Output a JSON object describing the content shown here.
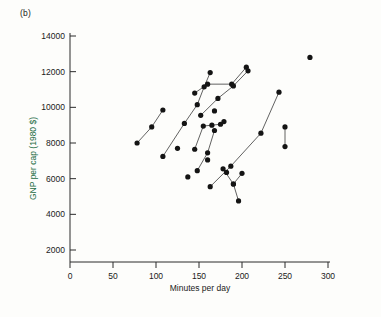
{
  "figure": {
    "panel_label": "(b)",
    "background_color": "#fdfdfb"
  },
  "axes": {
    "x": {
      "title": "Minutes per day",
      "ticks": [
        0,
        50,
        100,
        150,
        200,
        250,
        300
      ],
      "tick_labels": [
        "0",
        "50",
        "100",
        "150",
        "200",
        "250",
        "300"
      ],
      "min": 0,
      "max": 300,
      "title_color": "#1a1a1a"
    },
    "y": {
      "title": "GNP per cap (1980 $)",
      "ticks": [
        2000,
        4000,
        6000,
        8000,
        10000,
        12000,
        14000
      ],
      "tick_labels": [
        "2000",
        "4000",
        "6000",
        "8000",
        "10000",
        "12000",
        "14000"
      ],
      "min": 0,
      "max": 14800,
      "title_color": "#1a6b42"
    }
  },
  "chart_data": {
    "type": "scatter",
    "title": "",
    "xlabel": "Minutes per day",
    "ylabel": "GNP per cap (1980 $)",
    "xlim": [
      0,
      300
    ],
    "ylim": [
      0,
      14800
    ],
    "grid": false,
    "legend": null,
    "marker_color": "#141414",
    "line_color": "#3a3a3a",
    "note": "Connected point pairs/chains are trajectories for one country over time; isolated dots are unconnected observations.",
    "series": [
      {
        "name": "trajectory-1",
        "connected": true,
        "color": "#141414",
        "points": [
          {
            "x": 78,
            "y": 8000
          },
          {
            "x": 95,
            "y": 8900
          },
          {
            "x": 108,
            "y": 9850
          }
        ]
      },
      {
        "name": "trajectory-2",
        "connected": true,
        "color": "#141414",
        "points": [
          {
            "x": 108,
            "y": 7250
          },
          {
            "x": 133,
            "y": 9100
          },
          {
            "x": 148,
            "y": 10150
          },
          {
            "x": 156,
            "y": 11150
          },
          {
            "x": 163,
            "y": 11950
          }
        ]
      },
      {
        "name": "trajectory-3",
        "connected": true,
        "color": "#141414",
        "points": [
          {
            "x": 145,
            "y": 10800
          },
          {
            "x": 160,
            "y": 11300
          },
          {
            "x": 188,
            "y": 11300
          },
          {
            "x": 205,
            "y": 12250
          }
        ]
      },
      {
        "name": "trajectory-4",
        "connected": true,
        "color": "#141414",
        "points": [
          {
            "x": 152,
            "y": 9550
          },
          {
            "x": 172,
            "y": 10500
          },
          {
            "x": 190,
            "y": 11200
          },
          {
            "x": 207,
            "y": 12050
          }
        ]
      },
      {
        "name": "trajectory-5",
        "connected": true,
        "color": "#141414",
        "points": [
          {
            "x": 145,
            "y": 7650
          },
          {
            "x": 155,
            "y": 8950
          },
          {
            "x": 165,
            "y": 9000
          },
          {
            "x": 175,
            "y": 9050
          }
        ]
      },
      {
        "name": "trajectory-6",
        "connected": true,
        "color": "#141414",
        "points": [
          {
            "x": 148,
            "y": 6450
          },
          {
            "x": 160,
            "y": 7450
          },
          {
            "x": 168,
            "y": 8700
          }
        ]
      },
      {
        "name": "trajectory-7",
        "connected": true,
        "color": "#141414",
        "points": [
          {
            "x": 163,
            "y": 5550
          },
          {
            "x": 187,
            "y": 6700
          },
          {
            "x": 222,
            "y": 8550
          },
          {
            "x": 243,
            "y": 10850
          }
        ]
      },
      {
        "name": "trajectory-8",
        "connected": true,
        "color": "#141414",
        "points": [
          {
            "x": 178,
            "y": 6550
          },
          {
            "x": 190,
            "y": 5700
          },
          {
            "x": 196,
            "y": 4750
          }
        ]
      },
      {
        "name": "trajectory-9",
        "connected": true,
        "color": "#141414",
        "points": [
          {
            "x": 190,
            "y": 5700
          },
          {
            "x": 200,
            "y": 6300
          }
        ]
      },
      {
        "name": "trajectory-10",
        "connected": true,
        "color": "#141414",
        "points": [
          {
            "x": 250,
            "y": 8900
          },
          {
            "x": 250,
            "y": 7800
          }
        ]
      },
      {
        "name": "unconnected-observations",
        "connected": false,
        "color": "#141414",
        "points": [
          {
            "x": 125,
            "y": 7700
          },
          {
            "x": 137,
            "y": 6100
          },
          {
            "x": 160,
            "y": 7050
          },
          {
            "x": 168,
            "y": 9800
          },
          {
            "x": 179,
            "y": 9200
          },
          {
            "x": 182,
            "y": 6350
          }
        ]
      },
      {
        "name": "highlighted-outlier",
        "connected": false,
        "color": "#1e7a28",
        "points": [
          {
            "x": 279,
            "y": 12800
          }
        ]
      }
    ]
  }
}
